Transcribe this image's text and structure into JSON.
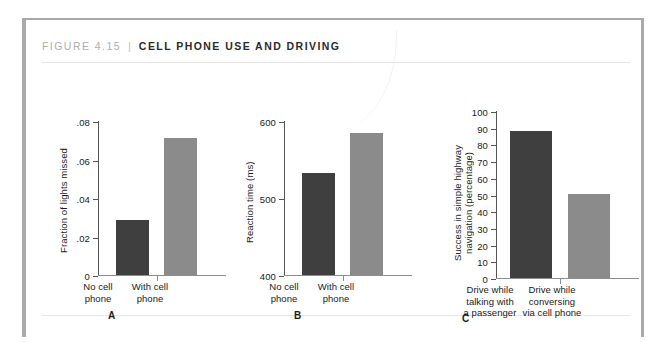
{
  "figure": {
    "number": "FIGURE 4.15",
    "separator": "|",
    "title": "CELL PHONE USE AND DRIVING",
    "colors": {
      "bar_dark": "#3f3f3f",
      "bar_light": "#8b8b8b",
      "frame": "#a9a9a9",
      "rule": "#e3e3e3",
      "axis": "#555555",
      "label_text": "#1a1a1a",
      "number_text": "#aeaeae"
    }
  },
  "chart_data": [
    {
      "type": "bar",
      "panel": "A",
      "title": "",
      "xlabel": "",
      "ylabel": "Fraction of lights missed",
      "categories": [
        "No cell\nphone",
        "With cell\nphone"
      ],
      "values": [
        0.0285,
        0.0712
      ],
      "value_labels": [
        ".0285",
        ".0712"
      ],
      "ylim": [
        0,
        0.08
      ],
      "yticks": [
        0,
        0.02,
        0.04,
        0.06,
        0.08
      ],
      "ytick_labels": [
        "0",
        ".02",
        ".04",
        ".06",
        ".08"
      ],
      "bar_colors": [
        "#3f3f3f",
        "#8b8b8b"
      ],
      "grid": false,
      "legend": "none"
    },
    {
      "type": "bar",
      "panel": "B",
      "title": "",
      "xlabel": "",
      "ylabel": "Reaction time (ms)",
      "categories": [
        "No cell\nphone",
        "With cell\nphone"
      ],
      "values": [
        533,
        585
      ],
      "value_labels": [
        "533",
        "585"
      ],
      "ylim": [
        400,
        600
      ],
      "yticks": [
        400,
        500,
        600
      ],
      "ytick_labels": [
        "400",
        "500",
        "600"
      ],
      "bar_colors": [
        "#3f3f3f",
        "#8b8b8b"
      ],
      "grid": false,
      "legend": "none"
    },
    {
      "type": "bar",
      "panel": "C",
      "title": "",
      "xlabel": "",
      "ylabel": "Success in simple highway\nnavigation (percentage)",
      "categories": [
        "Drive while\ntalking with\na passenger",
        "Drive while\nconversing\nvia cell phone"
      ],
      "values": [
        88,
        50.5
      ],
      "value_labels": [
        "88",
        "50.5"
      ],
      "ylim": [
        0,
        100
      ],
      "yticks": [
        0,
        10,
        20,
        30,
        40,
        50,
        60,
        70,
        80,
        90,
        100
      ],
      "ytick_labels": [
        "0",
        "10",
        "20",
        "30",
        "40",
        "50",
        "60",
        "70",
        "80",
        "90",
        "100"
      ],
      "bar_colors": [
        "#3f3f3f",
        "#8b8b8b"
      ],
      "grid": false,
      "legend": "none"
    }
  ],
  "panel_letters": {
    "a": "A",
    "b": "B",
    "c": "C"
  }
}
